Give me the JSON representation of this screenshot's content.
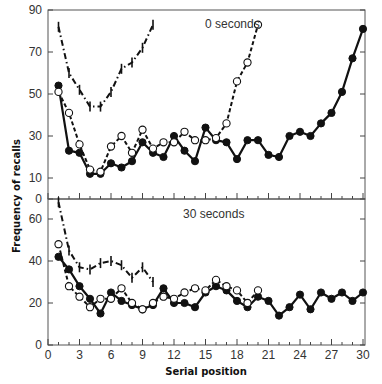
{
  "chart_data": [
    {
      "type": "line",
      "panel": "upper",
      "title": "0 seconds",
      "xlabel": "Serial position",
      "ylabel": "Frequency of recalls",
      "xlim": [
        0,
        30
      ],
      "ylim": [
        0,
        90
      ],
      "xticks": [
        0,
        3,
        6,
        9,
        12,
        15,
        18,
        21,
        24,
        27,
        30
      ],
      "yticks": [
        0,
        10,
        30,
        50,
        70,
        90
      ],
      "grid": false,
      "series": [
        {
          "name": "filled-circles-solid",
          "marker": "filled-circle",
          "line": "solid",
          "x": [
            1,
            2,
            3,
            4,
            5,
            6,
            7,
            8,
            9,
            10,
            11,
            12,
            13,
            14,
            15,
            16,
            17,
            18,
            19,
            20,
            21,
            22,
            23,
            24,
            25,
            26,
            27,
            28,
            29,
            30
          ],
          "values": [
            54,
            23,
            22,
            12,
            12,
            17,
            15,
            18,
            27,
            22,
            20,
            30,
            23,
            18,
            34,
            28,
            27,
            19,
            28,
            28,
            21,
            20,
            30,
            32,
            30,
            36,
            41,
            51,
            67,
            81
          ]
        },
        {
          "name": "open-circles-dashed",
          "marker": "open-circle",
          "line": "dashed",
          "x": [
            1,
            2,
            3,
            4,
            5,
            6,
            7,
            8,
            9,
            10,
            11,
            12,
            13,
            14,
            15,
            16,
            17,
            18,
            19,
            20
          ],
          "values": [
            51,
            41,
            26,
            14,
            13,
            25,
            30,
            22,
            33,
            24,
            27,
            27,
            32,
            28,
            28,
            29,
            36,
            56,
            65,
            83
          ]
        },
        {
          "name": "ticks-dashdot",
          "marker": "vertical-tick",
          "line": "dash-dot",
          "x": [
            1,
            2,
            3,
            4,
            5,
            6,
            7,
            8,
            9,
            10
          ],
          "values": [
            82,
            60,
            52,
            44,
            44,
            51,
            62,
            65,
            72,
            83
          ]
        }
      ]
    },
    {
      "type": "line",
      "panel": "lower",
      "title": "30 seconds",
      "xlabel": "Serial position",
      "ylabel": "Frequency of recalls",
      "xlim": [
        0,
        30
      ],
      "ylim": [
        0,
        70
      ],
      "xticks": [
        0,
        3,
        6,
        9,
        12,
        15,
        18,
        21,
        24,
        27,
        30
      ],
      "yticks": [
        0,
        20,
        40,
        60
      ],
      "grid": false,
      "series": [
        {
          "name": "filled-circles-solid",
          "marker": "filled-circle",
          "line": "solid",
          "x": [
            1,
            2,
            3,
            4,
            5,
            6,
            7,
            8,
            9,
            10,
            11,
            12,
            13,
            14,
            15,
            16,
            17,
            18,
            19,
            20,
            21,
            22,
            23,
            24,
            25,
            26,
            27,
            28,
            29,
            30
          ],
          "values": [
            42,
            36,
            28,
            22,
            15,
            25,
            21,
            19,
            17,
            19,
            27,
            20,
            20,
            18,
            25,
            28,
            26,
            21,
            18,
            23,
            21,
            14,
            18,
            24,
            17,
            25,
            22,
            25,
            21,
            25
          ]
        },
        {
          "name": "open-circles-dashed",
          "marker": "open-circle",
          "line": "dashed",
          "x": [
            1,
            2,
            3,
            4,
            5,
            6,
            7,
            8,
            9,
            10,
            11,
            12,
            13,
            14,
            15,
            16,
            17,
            18,
            19,
            20
          ],
          "values": [
            48,
            28,
            23,
            18,
            22,
            22,
            27,
            20,
            17,
            20,
            23,
            22,
            25,
            27,
            26,
            31,
            28,
            26,
            20,
            26
          ]
        },
        {
          "name": "ticks-dashdot",
          "marker": "vertical-tick",
          "line": "dash-dot",
          "x": [
            1,
            2,
            3,
            4,
            5,
            6,
            7,
            8,
            9,
            10
          ],
          "values": [
            68,
            45,
            37,
            36,
            39,
            40,
            38,
            32,
            37,
            30
          ]
        }
      ]
    }
  ],
  "labels": {
    "ylabel": "Frequency of recalls",
    "xlabel": "Serial position",
    "upper_panel": "0 seconds",
    "lower_panel": "30 seconds"
  },
  "colors": {
    "ink": "#111111",
    "axis": "#555555",
    "background": "#ffffff"
  }
}
